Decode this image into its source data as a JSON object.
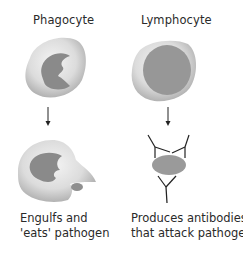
{
  "columns": [
    {
      "title": "Phagocyte",
      "caption": "Engulfs and\n'eats' pathogen"
    },
    {
      "title": "Lymphocyte",
      "caption": "Produces antibodies\nthat attack pathogens"
    }
  ],
  "colors": {
    "cell_light": "#e6e6e6",
    "cell_dark": "#b4b4b4",
    "nucleus": "#8a8a8a",
    "lymph_nucleus": "#979797",
    "line": "#222222"
  }
}
